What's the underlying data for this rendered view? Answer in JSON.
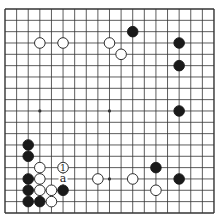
{
  "board": {
    "size": 19,
    "origin_x": 5,
    "origin_y": 9,
    "step_x": 11.61,
    "step_y": 11.33,
    "stone_radius": 5.3,
    "line_color": "#333333",
    "black_color": "#1a1a1a",
    "white_color": "#ffffff",
    "star_points": [
      [
        3,
        3
      ],
      [
        9,
        3
      ],
      [
        15,
        3
      ],
      [
        3,
        9
      ],
      [
        9,
        9
      ],
      [
        15,
        9
      ],
      [
        3,
        15
      ],
      [
        9,
        15
      ],
      [
        15,
        15
      ]
    ],
    "stones": [
      {
        "color": "white",
        "col": 3,
        "row": 3
      },
      {
        "color": "white",
        "col": 5,
        "row": 3
      },
      {
        "color": "white",
        "col": 9,
        "row": 3
      },
      {
        "color": "white",
        "col": 10,
        "row": 4
      },
      {
        "color": "black",
        "col": 11,
        "row": 2
      },
      {
        "color": "black",
        "col": 15,
        "row": 3
      },
      {
        "color": "black",
        "col": 15,
        "row": 5
      },
      {
        "color": "black",
        "col": 15,
        "row": 9
      },
      {
        "color": "black",
        "col": 2,
        "row": 12
      },
      {
        "color": "black",
        "col": 2,
        "row": 13
      },
      {
        "color": "white",
        "col": 3,
        "row": 14
      },
      {
        "color": "white",
        "col": 5,
        "row": 14,
        "label": "1"
      },
      {
        "color": "black",
        "col": 2,
        "row": 15
      },
      {
        "color": "white",
        "col": 3,
        "row": 15
      },
      {
        "color": "black",
        "col": 2,
        "row": 16
      },
      {
        "color": "white",
        "col": 3,
        "row": 16
      },
      {
        "color": "white",
        "col": 4,
        "row": 16
      },
      {
        "color": "black",
        "col": 5,
        "row": 16
      },
      {
        "color": "black",
        "col": 2,
        "row": 17
      },
      {
        "color": "black",
        "col": 3,
        "row": 17
      },
      {
        "color": "white",
        "col": 4,
        "row": 17
      },
      {
        "color": "white",
        "col": 8,
        "row": 15
      },
      {
        "color": "white",
        "col": 11,
        "row": 15
      },
      {
        "color": "black",
        "col": 13,
        "row": 14
      },
      {
        "color": "black",
        "col": 15,
        "row": 15
      },
      {
        "color": "white",
        "col": 13,
        "row": 16
      }
    ],
    "markers": [
      {
        "col": 5,
        "row": 15,
        "label": "a"
      }
    ]
  },
  "caption": {
    "text": ""
  }
}
